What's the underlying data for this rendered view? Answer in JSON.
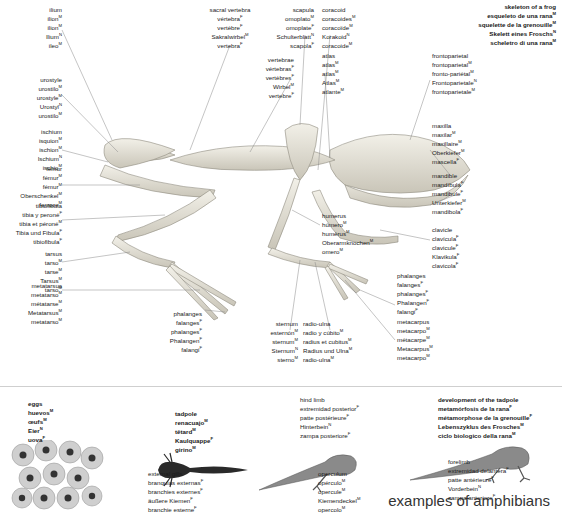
{
  "page": {
    "caption": "examples of amphibians",
    "colors": {
      "bone": "#e9e6dc",
      "bone_shade": "#b9b5a8",
      "ink": "#1a1a1a",
      "leader": "#8a8a8a",
      "egg": "#bcbcbc",
      "egg_core": "#3a3a3a",
      "tadpole": "#2a2a2a"
    }
  },
  "skeleton_title": {
    "lines": [
      "skeleton of a frog",
      "esqueleto de una rana",
      "squelette de la grenouille",
      "Skelett eines Froschs",
      "scheletro di una rana"
    ],
    "genders": [
      "",
      "M",
      "M",
      "N",
      "M"
    ]
  },
  "labels": [
    {
      "id": "ilium",
      "lines": [
        [
          "ilium",
          ""
        ],
        [
          "ilion",
          "M"
        ],
        [
          "ilion",
          "M"
        ],
        [
          "Ilium",
          "N"
        ],
        [
          "ileo",
          "M"
        ]
      ]
    },
    {
      "id": "sacral-vertebra",
      "lines": [
        [
          "sacral vertebra",
          ""
        ],
        [
          "vértebra",
          "F"
        ],
        [
          "vertèbre",
          "F"
        ],
        [
          "Sakralwirbel",
          "M"
        ],
        [
          "vertebra",
          "F"
        ]
      ]
    },
    {
      "id": "scapula",
      "lines": [
        [
          "scapula",
          ""
        ],
        [
          "omoplato",
          "M"
        ],
        [
          "omoplate",
          "F"
        ],
        [
          "Schulterblatt",
          "N"
        ],
        [
          "scapola",
          "F"
        ]
      ]
    },
    {
      "id": "coracoid",
      "lines": [
        [
          "coracoid",
          ""
        ],
        [
          "coracoides",
          "M"
        ],
        [
          "coracoïde",
          "M"
        ],
        [
          "Korakoid",
          "N"
        ],
        [
          "coracoide",
          "M"
        ]
      ]
    },
    {
      "id": "urostyle",
      "lines": [
        [
          "urostyle",
          ""
        ],
        [
          "urostilo",
          "M"
        ],
        [
          "urostyle",
          "M"
        ],
        [
          "Urostyl",
          "N"
        ],
        [
          "urostilo",
          "M"
        ]
      ]
    },
    {
      "id": "vertebrae",
      "lines": [
        [
          "vertebrae",
          ""
        ],
        [
          "vértebras",
          "F"
        ],
        [
          "vertèbres",
          "F"
        ],
        [
          "Wirbel",
          "M"
        ],
        [
          "vertebre",
          "F"
        ]
      ]
    },
    {
      "id": "atlas",
      "lines": [
        [
          "atlas",
          ""
        ],
        [
          "atlas",
          "M"
        ],
        [
          "atlas",
          "M"
        ],
        [
          "Atlas",
          "M"
        ],
        [
          "atlante",
          "M"
        ]
      ]
    },
    {
      "id": "frontoparietal",
      "lines": [
        [
          "frontoparietal",
          ""
        ],
        [
          "frontoparietal",
          "M"
        ],
        [
          "fronto-pariétal",
          "M"
        ],
        [
          "Frontoparietale",
          "N"
        ],
        [
          "frontoparietale",
          "M"
        ]
      ]
    },
    {
      "id": "ischium",
      "lines": [
        [
          "ischium",
          ""
        ],
        [
          "isquion",
          "M"
        ],
        [
          "ischion",
          "M"
        ],
        [
          "Ischium",
          "N"
        ],
        [
          "ischio",
          "M"
        ]
      ]
    },
    {
      "id": "maxilla",
      "lines": [
        [
          "maxilla",
          ""
        ],
        [
          "maxilar",
          "M"
        ],
        [
          "maxillaire",
          "M"
        ],
        [
          "Oberkiefer",
          "M"
        ],
        [
          "mascella",
          "F"
        ]
      ]
    },
    {
      "id": "femur",
      "lines": [
        [
          "femur",
          ""
        ],
        [
          "fémur",
          "M"
        ],
        [
          "fémur",
          "M"
        ],
        [
          "Oberschenkel",
          "M"
        ],
        [
          "femore",
          "M"
        ]
      ]
    },
    {
      "id": "mandible",
      "lines": [
        [
          "mandible",
          ""
        ],
        [
          "mandíbula",
          "F"
        ],
        [
          "mandibule",
          "F"
        ],
        [
          "Unterkiefer",
          "M"
        ],
        [
          "mandibola",
          "F"
        ]
      ]
    },
    {
      "id": "tibiofibula",
      "lines": [
        [
          "tibiofibula",
          ""
        ],
        [
          "tibia y peroné",
          "F"
        ],
        [
          "tibia et péroné",
          "M"
        ],
        [
          "Tibia und Fibula",
          "F"
        ],
        [
          "tibiofibula",
          "F"
        ]
      ]
    },
    {
      "id": "clavicle",
      "lines": [
        [
          "clavicle",
          ""
        ],
        [
          "clavícula",
          "F"
        ],
        [
          "clavicule",
          "F"
        ],
        [
          "Klavikula",
          "F"
        ],
        [
          "clavicola",
          "F"
        ]
      ]
    },
    {
      "id": "humerus",
      "lines": [
        [
          "humerus",
          ""
        ],
        [
          "húmero",
          "M"
        ],
        [
          "humérus",
          "M"
        ],
        [
          "Oberarmknochen",
          "M"
        ],
        [
          "omero",
          "M"
        ]
      ]
    },
    {
      "id": "tarsus",
      "lines": [
        [
          "tarsus",
          ""
        ],
        [
          "tarso",
          "M"
        ],
        [
          "tarse",
          "M"
        ],
        [
          "Tarsus",
          "M"
        ],
        [
          "tarso",
          "M"
        ]
      ]
    },
    {
      "id": "metatarsus",
      "lines": [
        [
          "metatarsus",
          ""
        ],
        [
          "metatarso",
          "M"
        ],
        [
          "métatarse",
          "M"
        ],
        [
          "Metatarsus",
          "M"
        ],
        [
          "metatarso",
          "M"
        ]
      ]
    },
    {
      "id": "phalanges-foot",
      "lines": [
        [
          "phalanges",
          ""
        ],
        [
          "falanges",
          "F"
        ],
        [
          "phalanges",
          "F"
        ],
        [
          "Phalangen",
          "F"
        ],
        [
          "falangi",
          "F"
        ]
      ]
    },
    {
      "id": "phalanges-hand",
      "lines": [
        [
          "phalanges",
          ""
        ],
        [
          "falanges",
          "F"
        ],
        [
          "phalanges",
          "F"
        ],
        [
          "Phalangen",
          "F"
        ],
        [
          "falangi",
          "F"
        ]
      ]
    },
    {
      "id": "metacarpus",
      "lines": [
        [
          "metacarpus",
          ""
        ],
        [
          "metacarpo",
          "M"
        ],
        [
          "métacarpe",
          "M"
        ],
        [
          "Metacarpus",
          "M"
        ],
        [
          "metacarpo",
          "M"
        ]
      ]
    },
    {
      "id": "sternum",
      "lines": [
        [
          "sternum",
          ""
        ],
        [
          "esternón",
          "M"
        ],
        [
          "sternum",
          "M"
        ],
        [
          "Sternum",
          "N"
        ],
        [
          "sterno",
          "M"
        ]
      ]
    },
    {
      "id": "radio-ulna",
      "lines": [
        [
          "radio-ulna",
          ""
        ],
        [
          "radio y cúbito",
          "M"
        ],
        [
          "radius et cubitus",
          "M"
        ],
        [
          "Radius und Ulna",
          "M"
        ],
        [
          "radio-ulna",
          "M"
        ]
      ]
    }
  ],
  "amphibians": [
    {
      "id": "eggs",
      "bold": true,
      "lines": [
        [
          "eggs",
          ""
        ],
        [
          "huevos",
          "M"
        ],
        [
          "œufs",
          "M"
        ],
        [
          "Eier",
          "N"
        ],
        [
          "uova",
          "F"
        ]
      ]
    },
    {
      "id": "tadpole",
      "bold": true,
      "lines": [
        [
          "tadpole",
          ""
        ],
        [
          "renacuajo",
          "M"
        ],
        [
          "têtard",
          "M"
        ],
        [
          "Kaulquappe",
          "F"
        ],
        [
          "girino",
          "M"
        ]
      ]
    },
    {
      "id": "external-gills",
      "lines": [
        [
          "external gills",
          ""
        ],
        [
          "branquias externas",
          "F"
        ],
        [
          "branchies externes",
          "F"
        ],
        [
          "äußere Kiemen",
          "F"
        ],
        [
          "branchie esterne",
          "F"
        ]
      ]
    },
    {
      "id": "hind-limb",
      "lines": [
        [
          "hind limb",
          ""
        ],
        [
          "extremidad posterior",
          "F"
        ],
        [
          "patte postérieure",
          "F"
        ],
        [
          "Hinterbein",
          "N"
        ],
        [
          "zampa posteriore",
          "F"
        ]
      ]
    },
    {
      "id": "operculum",
      "lines": [
        [
          "operculum",
          ""
        ],
        [
          "opérculo",
          "M"
        ],
        [
          "opercule",
          "M"
        ],
        [
          "Kiemendeckel",
          "M"
        ],
        [
          "opercolo",
          "M"
        ]
      ]
    },
    {
      "id": "development",
      "bold": true,
      "lines": [
        [
          "development of the tadpole",
          ""
        ],
        [
          "metamórfosis de la rana",
          "F"
        ],
        [
          "métamorphose de la grenouille",
          "F"
        ],
        [
          "Lebenszyklus des Frosches",
          "M"
        ],
        [
          "ciclo biologico della rana",
          "M"
        ]
      ]
    },
    {
      "id": "forelimb",
      "lines": [
        [
          "forelimb",
          ""
        ],
        [
          "extremidad delantera",
          "F"
        ],
        [
          "patte antérieure",
          "F"
        ],
        [
          "Vorderbein",
          "N"
        ],
        [
          "zampa anteriore",
          "F"
        ]
      ]
    }
  ]
}
